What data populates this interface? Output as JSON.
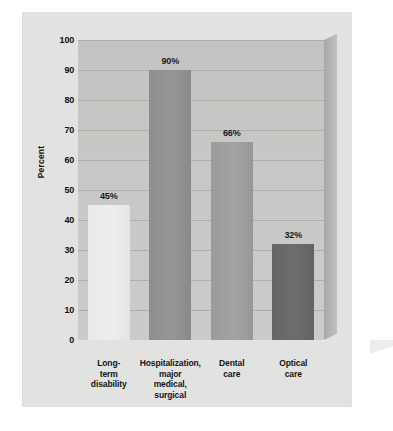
{
  "chart_data": {
    "type": "bar",
    "title": "",
    "xlabel": "",
    "ylabel": "Percent",
    "ylim": [
      0,
      100
    ],
    "ytick_step": 10,
    "grid": true,
    "legend": "none",
    "categories": [
      "Long-term disability",
      "Hospitalization, major medical, surgical",
      "Dental care",
      "Optical care"
    ],
    "category_lines": [
      [
        "Long-",
        "term",
        "disability"
      ],
      [
        "Hospitalization,",
        "major",
        "medical,",
        "surgical"
      ],
      [
        "Dental",
        "care"
      ],
      [
        "Optical",
        "care"
      ]
    ],
    "values": [
      45,
      90,
      66,
      32
    ],
    "value_labels": [
      "45%",
      "90%",
      "66%",
      "32%"
    ],
    "ytick_labels": [
      "100",
      "90",
      "80",
      "70",
      "60",
      "50",
      "40",
      "30",
      "20",
      "10",
      "0"
    ],
    "bar_colors": [
      "#ebebe9",
      "#929290",
      "#9f9f9d",
      "#69696 7"
    ]
  },
  "style": {
    "card_background": "#e2e2e0",
    "plot_background": "#c8c8c6",
    "gridline_color": "#a9a9a7",
    "floor_color": "#5e5e5c",
    "text_color": "#111111"
  }
}
